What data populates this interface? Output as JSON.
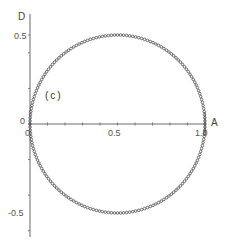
{
  "chart_data": {
    "type": "scatter",
    "title": "",
    "panel_label": "(c)",
    "xlabel": "A",
    "ylabel": "D",
    "xlim": [
      0,
      1.0
    ],
    "ylim": [
      -0.65,
      0.6
    ],
    "grid": false,
    "legend": null,
    "x_ticks": [
      0,
      0.1,
      0.2,
      0.3,
      0.4,
      0.5,
      0.6,
      0.7,
      0.8,
      0.9,
      1.0
    ],
    "x_tick_labels": {
      "0": "0",
      "0.5": "0.5",
      "1.0": "1.0"
    },
    "y_ticks": [
      -0.6,
      -0.4,
      -0.2,
      0,
      0.2,
      0.4,
      0.5
    ],
    "y_tick_labels": {
      "0.5": "0.5",
      "0": "0",
      "-0.5": "-0.5"
    },
    "series": [
      {
        "name": "circle locus",
        "shape": "circle",
        "center": [
          0.5,
          0
        ],
        "radius": 0.5,
        "marker": "open-circle",
        "n_points": 180,
        "description": "Densely sampled points lying on a circle through (0,0) and (1,0); upper half D>0, lower half D<0"
      }
    ],
    "sample_points": [
      [
        0.0,
        0.0
      ],
      [
        0.067,
        0.25
      ],
      [
        0.146,
        0.354
      ],
      [
        0.25,
        0.433
      ],
      [
        0.5,
        0.5
      ],
      [
        0.75,
        0.433
      ],
      [
        0.854,
        0.354
      ],
      [
        0.933,
        0.25
      ],
      [
        1.0,
        0.0
      ],
      [
        0.933,
        -0.25
      ],
      [
        0.854,
        -0.354
      ],
      [
        0.75,
        -0.433
      ],
      [
        0.5,
        -0.5
      ],
      [
        0.25,
        -0.433
      ],
      [
        0.146,
        -0.354
      ],
      [
        0.067,
        -0.25
      ]
    ]
  },
  "labels": {
    "x_axis_name": "A",
    "y_axis_name": "D",
    "panel": "(c)",
    "x_origin": "0",
    "y_origin": "0",
    "x_mid": "0.5",
    "x_end": "1.0",
    "y_top": "0.5",
    "y_bottom": "-0.5"
  }
}
